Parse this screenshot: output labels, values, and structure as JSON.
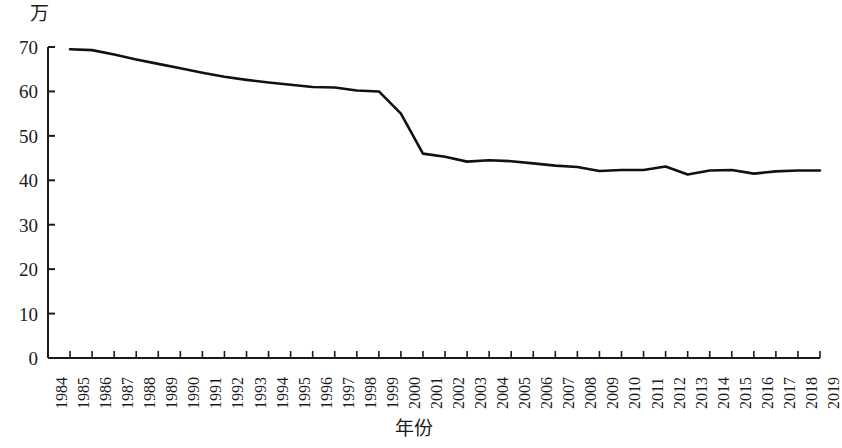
{
  "chart_data": {
    "type": "line",
    "title": "",
    "subtitle": "",
    "xlabel": "年份",
    "ylabel": "万",
    "unit_label": "万",
    "xlim": [
      1984,
      2019
    ],
    "ylim": [
      0,
      70
    ],
    "ytick_step": 10,
    "grid": false,
    "legend": null,
    "line_color": "#111111",
    "axis_color": "#1a1a1a",
    "yticks": [
      0,
      10,
      20,
      30,
      40,
      50,
      60,
      70
    ],
    "ytick_labels": [
      "0",
      "10",
      "20",
      "30",
      "40",
      "50",
      "60",
      "70"
    ],
    "categories": [
      "1984",
      "1985",
      "1986",
      "1987",
      "1988",
      "1989",
      "1990",
      "1991",
      "1992",
      "1993",
      "1994",
      "1995",
      "1996",
      "1997",
      "1998",
      "1999",
      "2000",
      "2001",
      "2002",
      "2003",
      "2004",
      "2005",
      "2006",
      "2007",
      "2008",
      "2009",
      "2010",
      "2011",
      "2012",
      "2013",
      "2014",
      "2015",
      "2016",
      "2017",
      "2018",
      "2019"
    ],
    "x": [
      1984,
      1985,
      1986,
      1987,
      1988,
      1989,
      1990,
      1991,
      1992,
      1993,
      1994,
      1995,
      1996,
      1997,
      1998,
      1999,
      2000,
      2001,
      2002,
      2003,
      2004,
      2005,
      2006,
      2007,
      2008,
      2009,
      2010,
      2011,
      2012,
      2013,
      2014,
      2015,
      2016,
      2017,
      2018,
      2019
    ],
    "values": [
      null,
      69.5,
      69.3,
      68.3,
      67.2,
      66.2,
      65.2,
      64.2,
      63.3,
      62.6,
      62.0,
      61.5,
      61.0,
      60.9,
      60.2,
      60.0,
      55.0,
      46.0,
      45.3,
      44.2,
      44.5,
      44.3,
      43.8,
      43.3,
      43.0,
      42.1,
      42.3,
      42.3,
      43.1,
      41.3,
      42.2,
      42.3,
      41.5,
      42.0,
      42.2,
      42.2
    ],
    "series": [
      {
        "name": "",
        "values": [
          null,
          69.5,
          69.3,
          68.3,
          67.2,
          66.2,
          65.2,
          64.2,
          63.3,
          62.6,
          62.0,
          61.5,
          61.0,
          60.9,
          60.2,
          60.0,
          55.0,
          46.0,
          45.3,
          44.2,
          44.5,
          44.3,
          43.8,
          43.3,
          43.0,
          42.1,
          42.3,
          42.3,
          43.1,
          41.3,
          42.2,
          42.3,
          41.5,
          42.0,
          42.2,
          42.2
        ]
      }
    ]
  }
}
